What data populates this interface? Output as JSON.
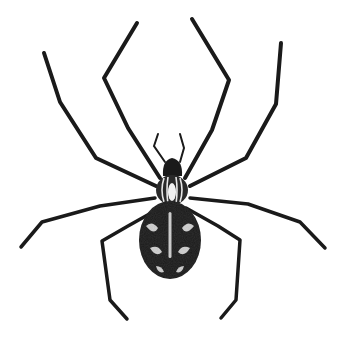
{
  "image": {
    "subject": "spider",
    "style": "pen-and-ink engraving illustration",
    "view": "dorsal (top-down)"
  },
  "colors": {
    "background": "#ffffff",
    "ink": "#1a1a1a",
    "highlight": "#e8e8e8"
  }
}
